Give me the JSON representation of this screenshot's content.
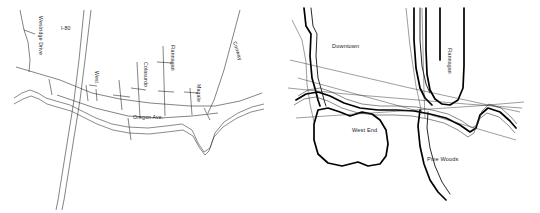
{
  "figure": {
    "background_color": "#ffffff",
    "ink_color": "#1d1d1d",
    "panel_count": 2
  },
  "left_map": {
    "name": "detailed-street-map",
    "street_labels": [
      {
        "id": "westridge-drive",
        "text": "Westridge Drive",
        "orientation": "vertical"
      },
      {
        "id": "i-80",
        "text": "I-80",
        "orientation": "horizontal"
      },
      {
        "id": "west",
        "text": "West",
        "orientation": "vertical"
      },
      {
        "id": "colasurdo",
        "text": "Colasurdo",
        "orientation": "vertical"
      },
      {
        "id": "flannagan",
        "text": "Flannagan",
        "orientation": "vertical"
      },
      {
        "id": "magale",
        "text": "Magale",
        "orientation": "vertical"
      },
      {
        "id": "conway",
        "text": "Conway",
        "orientation": "diagonal"
      },
      {
        "id": "oregon-ave",
        "text": "Oregon Ave.",
        "orientation": "horizontal"
      }
    ]
  },
  "right_map": {
    "name": "simplified-district-map",
    "area_labels": [
      {
        "id": "downtown",
        "text": "Downtown"
      },
      {
        "id": "west-end",
        "text": "West End"
      },
      {
        "id": "pine-woods",
        "text": "Pine Woods"
      }
    ],
    "street_labels": [
      {
        "id": "flannagan",
        "text": "Flannagan",
        "orientation": "vertical"
      }
    ]
  }
}
